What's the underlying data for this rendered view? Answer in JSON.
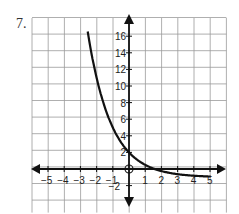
{
  "problem": {
    "number": "7."
  },
  "graph": {
    "x_tick_labels": [
      "−5",
      "−4",
      "−3",
      "−2",
      "−1",
      "1",
      "2",
      "3",
      "4",
      "5"
    ],
    "y_tick_labels": [
      "16",
      "14",
      "12",
      "10",
      "8",
      "6",
      "4",
      "2",
      "−2"
    ]
  },
  "chart_data": {
    "type": "line",
    "title": "",
    "xlabel": "",
    "ylabel": "",
    "x_ticks": [
      -5,
      -4,
      -3,
      -2,
      -1,
      1,
      2,
      3,
      4,
      5
    ],
    "y_ticks": [
      -2,
      2,
      4,
      6,
      8,
      10,
      12,
      14,
      16
    ],
    "xlim": [
      -6,
      6
    ],
    "ylim": [
      -4,
      18
    ],
    "grid": true,
    "origin_marker": "open-circle",
    "series": [
      {
        "name": "exponential decay curve",
        "x": [
          -2.6,
          -2,
          -1,
          0,
          1,
          1.6,
          2,
          3,
          4,
          5
        ],
        "y": [
          18,
          11,
          5,
          2,
          0.5,
          0,
          -0.25,
          -0.6,
          -0.8,
          -0.9
        ]
      }
    ]
  }
}
